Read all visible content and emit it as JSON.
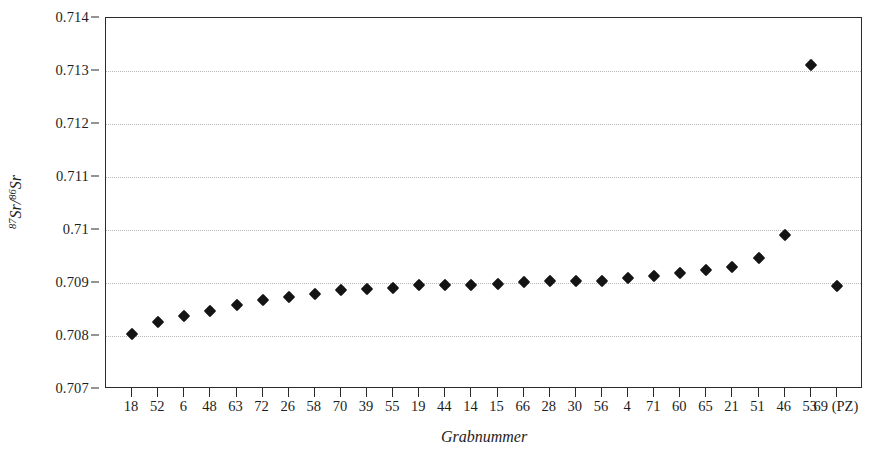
{
  "chart_data": {
    "type": "scatter",
    "title": "",
    "xlabel": "Grabnummer",
    "ylabel_html": "<sup>87</sup>Sr/<sup>86</sup>Sr",
    "ylabel_text": "87Sr/86Sr",
    "categories": [
      "18",
      "52",
      "6",
      "48",
      "63",
      "72",
      "26",
      "58",
      "70",
      "39",
      "55",
      "19",
      "44",
      "14",
      "15",
      "66",
      "28",
      "30",
      "56",
      "4",
      "71",
      "60",
      "65",
      "21",
      "51",
      "46",
      "53",
      "69 (PZ)"
    ],
    "values": [
      0.70803,
      0.70826,
      0.70838,
      0.70848,
      0.70858,
      0.70867,
      0.70873,
      0.70879,
      0.70886,
      0.70889,
      0.70891,
      0.70896,
      0.70897,
      0.70897,
      0.70898,
      0.70902,
      0.70903,
      0.70903,
      0.70903,
      0.7091,
      0.70913,
      0.70918,
      0.70925,
      0.70931,
      0.70948,
      0.7099,
      0.71312,
      0.70894
    ],
    "ylim": [
      0.707,
      0.714
    ],
    "yticks": [
      0.707,
      0.708,
      0.709,
      0.71,
      0.711,
      0.712,
      0.713,
      0.714
    ],
    "ytick_labels": [
      "0.707",
      "0.708",
      "0.709",
      "0.71",
      "0.711",
      "0.712",
      "0.713",
      "0.714"
    ],
    "grid": "horizontal-dotted",
    "legend": "none",
    "marker": "filled-diamond",
    "marker_color": "#141414",
    "frame_color": "#2b2b2b",
    "gridline_color": "#b9b9b9",
    "background_color": "#ffffff"
  }
}
